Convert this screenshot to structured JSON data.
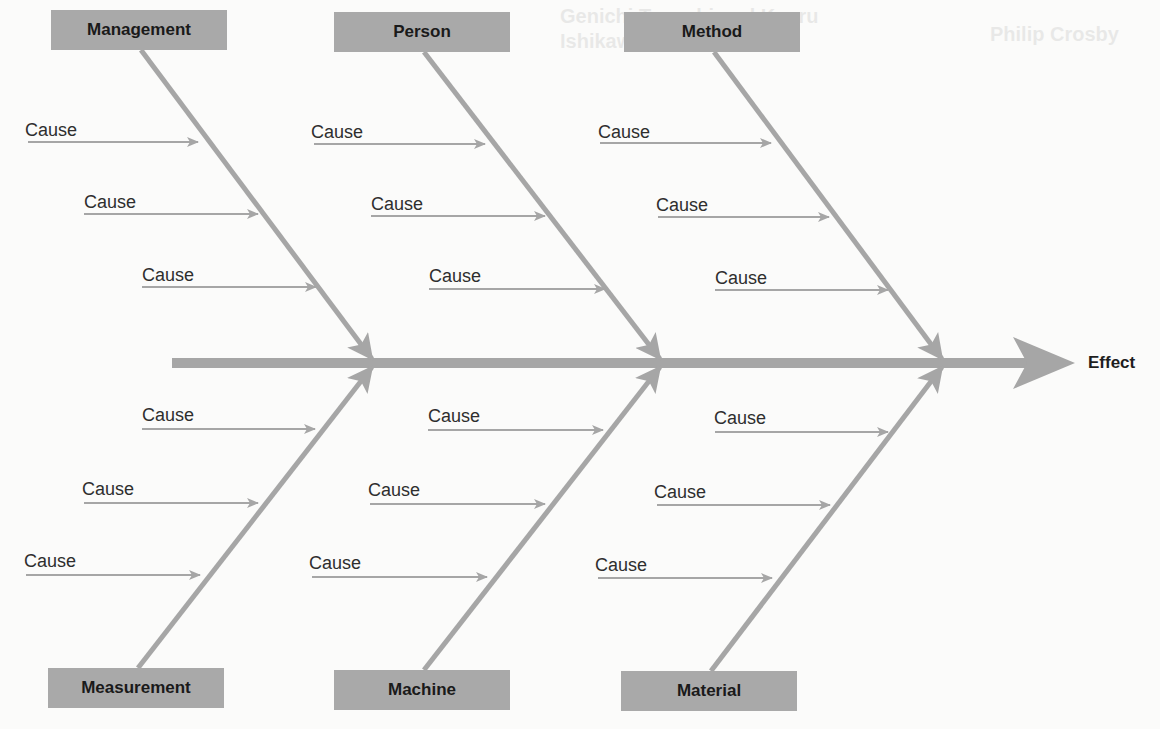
{
  "diagram": {
    "type": "fishbone",
    "effect": {
      "label": "Effect"
    },
    "colors": {
      "bone": "#a6a6a6",
      "category_box": "#a9a9a9",
      "text": "#1e1e1e",
      "background": "#fbfbfa"
    },
    "categories_top": [
      {
        "label": "Management",
        "box": {
          "x": 51,
          "y": 10
        },
        "join_x": 372,
        "causes": [
          {
            "label": "Cause",
            "x": 25,
            "y": 120,
            "line_from": 28,
            "line_to": 198,
            "line_y": 142
          },
          {
            "label": "Cause",
            "x": 84,
            "y": 192,
            "line_from": 84,
            "line_to": 258,
            "line_y": 214
          },
          {
            "label": "Cause",
            "x": 142,
            "y": 265,
            "line_from": 142,
            "line_to": 316,
            "line_y": 287
          }
        ]
      },
      {
        "label": "Person",
        "box": {
          "x": 334,
          "y": 12
        },
        "join_x": 660,
        "causes": [
          {
            "label": "Cause",
            "x": 311,
            "y": 122,
            "line_from": 314,
            "line_to": 485,
            "line_y": 144
          },
          {
            "label": "Cause",
            "x": 371,
            "y": 194,
            "line_from": 371,
            "line_to": 545,
            "line_y": 216
          },
          {
            "label": "Cause",
            "x": 429,
            "y": 266,
            "line_from": 429,
            "line_to": 605,
            "line_y": 289
          }
        ]
      },
      {
        "label": "Method",
        "box": {
          "x": 624,
          "y": 12
        },
        "join_x": 942,
        "causes": [
          {
            "label": "Cause",
            "x": 598,
            "y": 122,
            "line_from": 600,
            "line_to": 771,
            "line_y": 143
          },
          {
            "label": "Cause",
            "x": 656,
            "y": 195,
            "line_from": 658,
            "line_to": 829,
            "line_y": 217
          },
          {
            "label": "Cause",
            "x": 715,
            "y": 268,
            "line_from": 715,
            "line_to": 888,
            "line_y": 290
          }
        ]
      }
    ],
    "categories_bottom": [
      {
        "label": "Measurement",
        "box": {
          "x": 48,
          "y": 668
        },
        "join_x": 372,
        "causes": [
          {
            "label": "Cause",
            "x": 142,
            "y": 405,
            "line_from": 142,
            "line_to": 315,
            "line_y": 429
          },
          {
            "label": "Cause",
            "x": 82,
            "y": 479,
            "line_from": 84,
            "line_to": 258,
            "line_y": 503
          },
          {
            "label": "Cause",
            "x": 24,
            "y": 551,
            "line_from": 26,
            "line_to": 200,
            "line_y": 575
          }
        ]
      },
      {
        "label": "Machine",
        "box": {
          "x": 334,
          "y": 670
        },
        "join_x": 660,
        "causes": [
          {
            "label": "Cause",
            "x": 428,
            "y": 406,
            "line_from": 428,
            "line_to": 603,
            "line_y": 430
          },
          {
            "label": "Cause",
            "x": 368,
            "y": 480,
            "line_from": 370,
            "line_to": 545,
            "line_y": 504
          },
          {
            "label": "Cause",
            "x": 309,
            "y": 553,
            "line_from": 312,
            "line_to": 487,
            "line_y": 577
          }
        ]
      },
      {
        "label": "Material",
        "box": {
          "x": 621,
          "y": 671
        },
        "join_x": 942,
        "causes": [
          {
            "label": "Cause",
            "x": 714,
            "y": 408,
            "line_from": 715,
            "line_to": 888,
            "line_y": 432
          },
          {
            "label": "Cause",
            "x": 654,
            "y": 482,
            "line_from": 657,
            "line_to": 830,
            "line_y": 505
          },
          {
            "label": "Cause",
            "x": 595,
            "y": 555,
            "line_from": 598,
            "line_to": 772,
            "line_y": 578
          }
        ]
      }
    ],
    "spine": {
      "x_start": 172,
      "x_end": 1075,
      "y": 363
    }
  },
  "background_text": {
    "left_title": "Genichi Taguchi and Kaoru Ishikawa",
    "right_title": "Philip Crosby"
  }
}
